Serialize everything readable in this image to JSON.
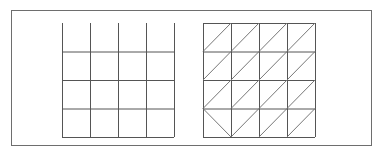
{
  "figure": {
    "left_grid": {
      "name": "square-grid",
      "cols": 4,
      "rows": 4,
      "x0": 62,
      "y0": 23,
      "cell_w": 28,
      "cell_h": 28.5,
      "top_border": false,
      "line_color": "#555555"
    },
    "right_grid": {
      "name": "triangulated-grid",
      "cols": 4,
      "rows": 4,
      "x0": 203,
      "y0": 23,
      "cell_w": 28,
      "cell_h": 28.5,
      "top_border": true,
      "line_color": "#555555",
      "diagonal_color": "#777777",
      "flipped_cells": [
        [
          3,
          0
        ]
      ]
    },
    "frame_color": "#6e6e6e"
  }
}
